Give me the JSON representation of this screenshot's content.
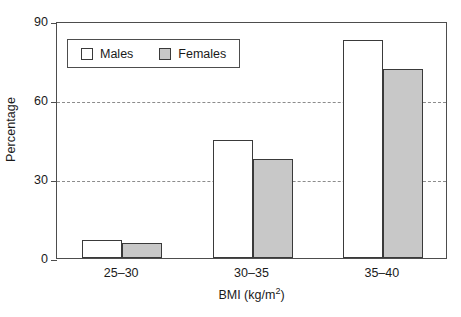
{
  "chart_data": {
    "type": "bar",
    "title": "",
    "xlabel": "BMI (kg/m2)",
    "xlabel_base": "BMI (kg/m",
    "xlabel_sup": "2",
    "xlabel_tail": ")",
    "ylabel": "Percentage",
    "categories": [
      "25–30",
      "30–35",
      "35–40"
    ],
    "series": [
      {
        "name": "Males",
        "values": [
          6.8,
          45.0,
          82.8
        ],
        "color": "#ffffff"
      },
      {
        "name": "Females",
        "values": [
          5.7,
          37.6,
          71.8
        ],
        "color": "#c8c8c8"
      }
    ],
    "ylim": [
      0,
      90
    ],
    "yticks": [
      0,
      30,
      60,
      90
    ],
    "ytick_labels": [
      "0",
      "30",
      "60",
      "90"
    ],
    "grid": "horizontal-dashed-at-30-and-60",
    "legend_position": "upper-left-inside",
    "axis_color": "#4d4d4d",
    "grid_color": "#8c8c8c",
    "bar_edge_color": "#3a3a3a"
  }
}
